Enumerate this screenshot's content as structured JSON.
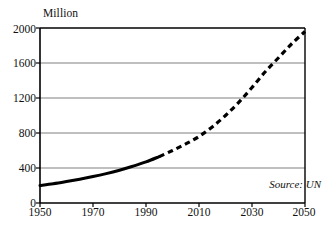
{
  "chart_data": {
    "type": "line",
    "title": "",
    "subtitle": "",
    "xlabel": "",
    "ylabel": "Million",
    "unit_label": "Million",
    "xlim": [
      1950,
      2050
    ],
    "ylim": [
      0,
      2000
    ],
    "grid": true,
    "grid_axis": "y",
    "legend_position": "none",
    "x_tick_labels": [
      "1950",
      "1970",
      "1990",
      "2010",
      "2030",
      "2050"
    ],
    "x_ticks": [
      1950,
      1970,
      1990,
      2010,
      2030,
      2050
    ],
    "y_tick_labels": [
      "0",
      "400",
      "800",
      "1200",
      "1600",
      "2000"
    ],
    "y_ticks": [
      0,
      400,
      800,
      1200,
      1600,
      2000
    ],
    "annotations": [
      {
        "text": "Source: UN",
        "style": "italic",
        "position": "bottom-right"
      }
    ],
    "series": [
      {
        "name": "Historical",
        "style": "solid",
        "color": "#000000",
        "x": [
          1950,
          1955,
          1960,
          1965,
          1970,
          1975,
          1980,
          1985,
          1990,
          1995
        ],
        "values": [
          200,
          220,
          245,
          272,
          302,
          336,
          375,
          420,
          470,
          530
        ]
      },
      {
        "name": "Projection",
        "style": "dashed",
        "color": "#000000",
        "x": [
          1995,
          2000,
          2005,
          2010,
          2015,
          2020,
          2025,
          2030,
          2035,
          2040,
          2045,
          2050
        ],
        "values": [
          530,
          600,
          675,
          760,
          870,
          1000,
          1150,
          1320,
          1500,
          1660,
          1820,
          1960
        ]
      }
    ]
  },
  "axis": {
    "unit": "Million",
    "source": "Source: UN"
  }
}
